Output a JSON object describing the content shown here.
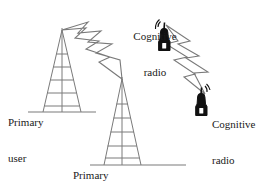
{
  "figure": {
    "background_color": "#ffffff",
    "line_color": "#7a7a7a",
    "device_color": "#111111",
    "text_color": "#1a1a1a",
    "width": 267,
    "height": 181
  },
  "labels": {
    "primary_user_1": {
      "line1": "Primary",
      "line2": "user"
    },
    "primary_user_2": {
      "line1": "Primary",
      "line2": "user"
    },
    "cognitive_radio_1": {
      "line1": "Cognitive",
      "line2": "radio"
    },
    "cognitive_radio_2": {
      "line1": "Cognitive",
      "line2": "radio"
    }
  },
  "nodes": [
    {
      "id": "primary-user-tower-1",
      "type": "transmission-tower",
      "apex": {
        "x": 62,
        "y": 30
      },
      "base_left": {
        "x": 43,
        "y": 112
      },
      "base_right": {
        "x": 81,
        "y": 112
      },
      "ground_line": {
        "x1": 28,
        "x2": 96,
        "y": 112
      },
      "crossbars": 5
    },
    {
      "id": "primary-user-tower-2",
      "type": "transmission-tower",
      "apex": {
        "x": 122,
        "y": 79
      },
      "base_left": {
        "x": 104,
        "y": 165
      },
      "base_right": {
        "x": 141,
        "y": 165
      },
      "ground_line": {
        "x1": 90,
        "x2": 186,
        "y": 165
      },
      "crossbars": 5
    },
    {
      "id": "cognitive-radio-device-1",
      "type": "handheld-radio",
      "x": 163,
      "y": 32
    },
    {
      "id": "cognitive-radio-device-2",
      "type": "handheld-radio",
      "x": 200,
      "y": 97
    }
  ],
  "links": [
    {
      "id": "primary-link",
      "type": "lightning-bolt-signal",
      "from": "primary-user-tower-1",
      "to": "primary-user-tower-2"
    },
    {
      "id": "cognitive-link",
      "type": "lightning-bolt-signal",
      "from": "cognitive-radio-device-1",
      "to": "cognitive-radio-device-2"
    }
  ]
}
